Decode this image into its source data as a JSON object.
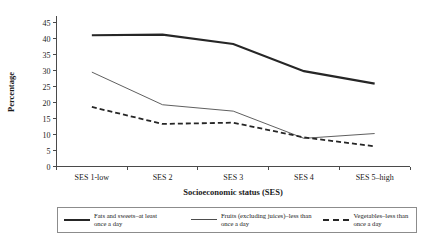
{
  "chart_data": {
    "type": "line",
    "title": "",
    "xlabel": "Socioeconomic status (SES)",
    "ylabel": "Percentage",
    "categories": [
      "SES 1-low",
      "SES 2",
      "SES 3",
      "SES 4",
      "SES 5–high"
    ],
    "yticks": [
      0,
      5,
      10,
      15,
      20,
      25,
      30,
      35,
      40,
      45
    ],
    "ylim": [
      0,
      45
    ],
    "grid": false,
    "legend_position": "bottom",
    "series": [
      {
        "name": "Fats and sweets–at least once a day",
        "name_line1": "Fats and sweets–at least",
        "name_line2": "once a day",
        "style": "thick-solid",
        "color": "#262626",
        "values": [
          41.0,
          41.2,
          38.3,
          29.8,
          25.9
        ]
      },
      {
        "name": "Fruits (excluding juices)–less than once a day",
        "name_line1": "Fruits (excluding juices)–less than",
        "name_line2": "once a day",
        "style": "thin-solid",
        "color": "#4d4d4d",
        "values": [
          29.5,
          19.3,
          17.3,
          8.8,
          10.3
        ]
      },
      {
        "name": "Vegetables–less than once a day",
        "name_line1": "Vegetables–less than",
        "name_line2": "once a day",
        "style": "dashed",
        "color": "#262626",
        "values": [
          18.6,
          13.3,
          13.7,
          9.1,
          6.3
        ]
      }
    ]
  }
}
